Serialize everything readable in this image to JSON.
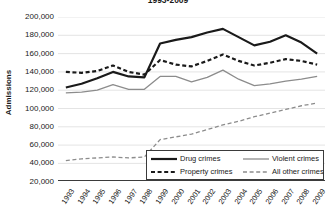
{
  "title": "1993-2009",
  "axes": {
    "y_label": "Admissions",
    "y_ticks": [
      "200,000",
      "180,000",
      "160,000",
      "140,000",
      "120,000",
      "100,000",
      "80,000",
      "60,000",
      "40,000",
      "20,000"
    ],
    "x_ticks": [
      "1993",
      "1994",
      "1995",
      "1996",
      "1997",
      "1998",
      "1999",
      "2000",
      "2001",
      "2002",
      "2003",
      "2004",
      "2005",
      "2006",
      "2007",
      "2008",
      "2009"
    ]
  },
  "legend": {
    "items": [
      {
        "label": "Drug crimes",
        "style": "thick-solid",
        "color": "#1a1a1a"
      },
      {
        "label": "Violent crimes",
        "style": "thin-solid",
        "color": "#8c8c8c"
      },
      {
        "label": "Property crimes",
        "style": "thick-dashed",
        "color": "#1a1a1a"
      },
      {
        "label": "All other crimes",
        "style": "thin-dashed",
        "color": "#8c8c8c"
      }
    ]
  },
  "chart_data": {
    "type": "line",
    "title": "1993-2009",
    "xlabel": "",
    "ylabel": "Admissions",
    "ylim": [
      20000,
      200000
    ],
    "ytick_step": 20000,
    "grid": true,
    "legend_position": "inside-bottom-right",
    "x": [
      1993,
      1994,
      1995,
      1996,
      1997,
      1998,
      1999,
      2000,
      2001,
      2002,
      2003,
      2004,
      2005,
      2006,
      2007,
      2008,
      2009
    ],
    "categories": [
      "1993",
      "1994",
      "1995",
      "1996",
      "1997",
      "1998",
      "1999",
      "2000",
      "2001",
      "2002",
      "2003",
      "2004",
      "2005",
      "2006",
      "2007",
      "2008",
      "2009"
    ],
    "series": [
      {
        "name": "Drug crimes",
        "color": "#1a1a1a",
        "style": "thick-solid",
        "values": [
          123000,
          127000,
          133000,
          140000,
          135000,
          134000,
          171000,
          175000,
          178000,
          183000,
          187000,
          178000,
          169000,
          173000,
          180000,
          172000,
          160000
        ]
      },
      {
        "name": "Property crimes",
        "color": "#1a1a1a",
        "style": "thick-dashed",
        "values": [
          140000,
          139000,
          141000,
          147000,
          140000,
          137000,
          153000,
          148000,
          146000,
          152000,
          159000,
          152000,
          147000,
          150000,
          154000,
          152000,
          148000
        ]
      },
      {
        "name": "Violent crimes",
        "color": "#8c8c8c",
        "style": "thin-solid",
        "values": [
          117000,
          118000,
          120000,
          126000,
          121000,
          121000,
          135000,
          135000,
          129000,
          134000,
          142000,
          132000,
          125000,
          127000,
          130000,
          132000,
          135000
        ]
      },
      {
        "name": "All other crimes",
        "color": "#8c8c8c",
        "style": "thin-dashed",
        "values": [
          43000,
          45000,
          46000,
          47000,
          46000,
          47000,
          66000,
          69000,
          72000,
          77000,
          82000,
          86000,
          91000,
          95000,
          99000,
          103000,
          106000
        ]
      }
    ]
  }
}
